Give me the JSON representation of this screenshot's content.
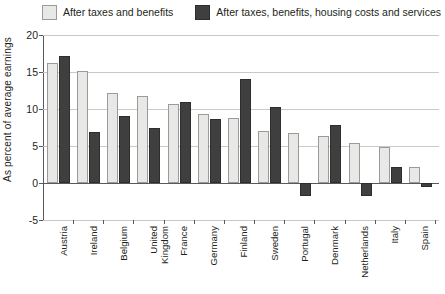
{
  "legend": {
    "entries": [
      {
        "label": "After taxes and benefits",
        "swatch": "light",
        "color": "#e8e8e6"
      },
      {
        "label": "After taxes, benefits, housing costs and services",
        "swatch": "dark",
        "color": "#3f3f3f"
      }
    ]
  },
  "axis": {
    "ylabel": "As percent of average earnings",
    "yticks": [
      20,
      15,
      10,
      5,
      0,
      -5
    ]
  },
  "chart_data": {
    "type": "bar",
    "title": "",
    "xlabel": "",
    "ylabel": "As percent of average earnings",
    "ylim": [
      -5,
      20
    ],
    "grid": true,
    "legend_position": "top",
    "categories": [
      "Austria",
      "Ireland",
      "Belgium",
      "United\nKingdom",
      "France",
      "Germany",
      "Finland",
      "Sweden",
      "Portugal",
      "Denmark",
      "Netherlands",
      "Italy",
      "Spain"
    ],
    "series": [
      {
        "name": "After taxes and benefits",
        "color": "#e8e8e6",
        "values": [
          16.2,
          15.2,
          12.1,
          11.7,
          10.7,
          9.3,
          8.8,
          7.0,
          6.7,
          6.3,
          5.4,
          4.9,
          2.2
        ]
      },
      {
        "name": "After taxes, benefits, housing costs and services",
        "color": "#3f3f3f",
        "values": [
          17.1,
          6.9,
          9.0,
          7.5,
          11.0,
          8.7,
          14.0,
          10.3,
          -1.8,
          7.8,
          -1.8,
          2.1,
          -0.6
        ]
      }
    ]
  }
}
